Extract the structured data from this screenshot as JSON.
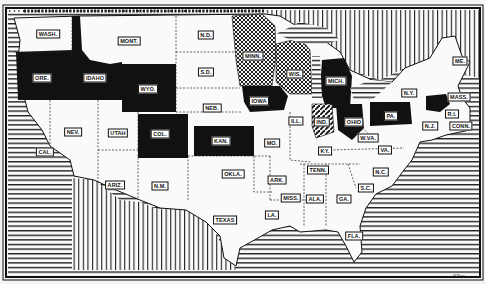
{
  "map": {
    "title": "",
    "type": "choropleth map of the United States (black & white, pattern-coded states)",
    "legend_visible": false,
    "credit_text": "W.Roos",
    "patterns": {
      "solid_black": [
        "ORE.",
        "IDAHO",
        "WYO.",
        "COL.",
        "KAN.",
        "IOWA",
        "MICH.",
        "OHIO",
        "PA.",
        "MASS."
      ],
      "crosshatch": [
        "MINN.",
        "WIS."
      ],
      "diagonal_hatch": [
        "IND."
      ],
      "white": [
        "WASH.",
        "MONT.",
        "N.D.",
        "S.D.",
        "NEB.",
        "NEV.",
        "UTAH",
        "CAL.",
        "ARIZ.",
        "N.M.",
        "OKLA.",
        "TEXAS",
        "MO.",
        "ARK.",
        "LA.",
        "MISS.",
        "ALA.",
        "GA.",
        "FLA.",
        "S.C.",
        "N.C.",
        "TENN.",
        "KY.",
        "W.VA.",
        "VA.",
        "ILL.",
        "N.Y.",
        "ME.",
        "R.I.",
        "CONN.",
        "N.J."
      ],
      "water_ocean": "horizontal lines",
      "foreign_land": "vertical lines"
    },
    "state_labels": [
      {
        "id": "wash",
        "text": "WASH.",
        "x": 48,
        "y": 34
      },
      {
        "id": "mont",
        "text": "MONT.",
        "x": 129,
        "y": 41
      },
      {
        "id": "nd",
        "text": "N.D.",
        "x": 206,
        "y": 35
      },
      {
        "id": "sd",
        "text": "S.D.",
        "x": 206,
        "y": 72
      },
      {
        "id": "neb",
        "text": "NEB.",
        "x": 212,
        "y": 108
      },
      {
        "id": "minn",
        "text": "MINN.",
        "x": 253,
        "y": 56
      },
      {
        "id": "wis",
        "text": "WIS.",
        "x": 295,
        "y": 74
      },
      {
        "id": "mich",
        "text": "MICH.",
        "x": 336,
        "y": 81
      },
      {
        "id": "ore",
        "text": "ORE.",
        "x": 42,
        "y": 78
      },
      {
        "id": "idaho",
        "text": "IDAHO",
        "x": 95,
        "y": 78
      },
      {
        "id": "wyo",
        "text": "WYO.",
        "x": 148,
        "y": 89
      },
      {
        "id": "iowa",
        "text": "IOWA",
        "x": 259,
        "y": 101
      },
      {
        "id": "ill",
        "text": "ILL.",
        "x": 296,
        "y": 121
      },
      {
        "id": "ind",
        "text": "IND.",
        "x": 322,
        "y": 122
      },
      {
        "id": "ohio",
        "text": "OHIO",
        "x": 354,
        "y": 122
      },
      {
        "id": "pa",
        "text": "PA.",
        "x": 391,
        "y": 116
      },
      {
        "id": "ny",
        "text": "N.Y.",
        "x": 409,
        "y": 93
      },
      {
        "id": "me",
        "text": "ME.",
        "x": 460,
        "y": 61
      },
      {
        "id": "mass",
        "text": "MASS.",
        "x": 459,
        "y": 97
      },
      {
        "id": "ri",
        "text": "R.I.",
        "x": 452,
        "y": 114
      },
      {
        "id": "conn",
        "text": "CONN.",
        "x": 461,
        "y": 126
      },
      {
        "id": "nj",
        "text": "N.J.",
        "x": 430,
        "y": 126
      },
      {
        "id": "wva",
        "text": "W.VA.",
        "x": 368,
        "y": 138
      },
      {
        "id": "va",
        "text": "VA.",
        "x": 385,
        "y": 150
      },
      {
        "id": "ky",
        "text": "KY.",
        "x": 325,
        "y": 151
      },
      {
        "id": "mo",
        "text": "MO.",
        "x": 272,
        "y": 143
      },
      {
        "id": "nev",
        "text": "NEV.",
        "x": 73,
        "y": 132
      },
      {
        "id": "utah",
        "text": "UTAH",
        "x": 118,
        "y": 133
      },
      {
        "id": "col",
        "text": "COL.",
        "x": 160,
        "y": 134
      },
      {
        "id": "kan",
        "text": "KAN.",
        "x": 221,
        "y": 141
      },
      {
        "id": "cal",
        "text": "CAL.",
        "x": 45,
        "y": 152
      },
      {
        "id": "ariz",
        "text": "ARIZ.",
        "x": 115,
        "y": 185
      },
      {
        "id": "nm",
        "text": "N.M.",
        "x": 160,
        "y": 186
      },
      {
        "id": "okla",
        "text": "OKLA.",
        "x": 233,
        "y": 174
      },
      {
        "id": "ark",
        "text": "ARK.",
        "x": 277,
        "y": 180
      },
      {
        "id": "tenn",
        "text": "TENN.",
        "x": 318,
        "y": 170
      },
      {
        "id": "nc",
        "text": "N.C.",
        "x": 381,
        "y": 172
      },
      {
        "id": "sc",
        "text": "S.C.",
        "x": 366,
        "y": 188
      },
      {
        "id": "miss",
        "text": "MISS.",
        "x": 291,
        "y": 198
      },
      {
        "id": "ala",
        "text": "ALA.",
        "x": 315,
        "y": 199
      },
      {
        "id": "ga",
        "text": "GA.",
        "x": 344,
        "y": 199
      },
      {
        "id": "la",
        "text": "LA.",
        "x": 272,
        "y": 215
      },
      {
        "id": "texas",
        "text": "TEXAS",
        "x": 225,
        "y": 220
      },
      {
        "id": "fla",
        "text": "FLA.",
        "x": 354,
        "y": 236
      }
    ]
  }
}
